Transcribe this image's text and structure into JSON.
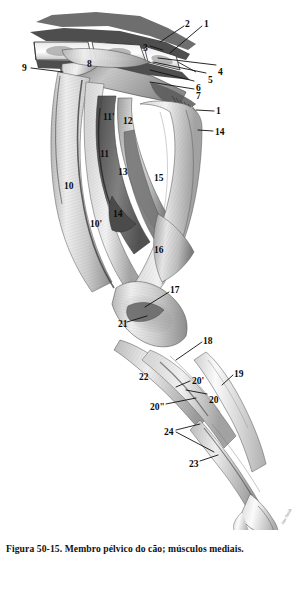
{
  "figure": {
    "caption": "Figura 50-15. Membro pélvico do cão; músculos mediais.",
    "signature": "Jane Smith",
    "colors": {
      "ink": "#0b0b0b",
      "paper": "#ffffff",
      "wash_dark": "#4a4a4a",
      "wash_mid": "#8e8e8e",
      "wash_light": "#d5d5d5",
      "leader_line": "#111111"
    },
    "labels": [
      {
        "id": "label-1-top",
        "text": "1",
        "x": 204,
        "y": 20,
        "leader": {
          "x1": 202,
          "y1": 26,
          "x2": 170,
          "y2": 53
        }
      },
      {
        "id": "label-2",
        "text": "2",
        "x": 185,
        "y": 20,
        "leader": {
          "x1": 184,
          "y1": 26,
          "x2": 160,
          "y2": 42
        }
      },
      {
        "id": "label-3",
        "text": "3",
        "x": 143,
        "y": 44,
        "leader": {
          "x1": 150,
          "y1": 46,
          "x2": 163,
          "y2": 50
        }
      },
      {
        "id": "label-4",
        "text": "4",
        "x": 218,
        "y": 68,
        "leader": {
          "x1": 216,
          "y1": 65,
          "x2": 158,
          "y2": 58
        }
      },
      {
        "id": "label-5",
        "text": "5",
        "x": 208,
        "y": 76,
        "leader": {
          "x1": 206,
          "y1": 73,
          "x2": 153,
          "y2": 62
        }
      },
      {
        "id": "label-6",
        "text": "6",
        "x": 196,
        "y": 84,
        "leader": {
          "x1": 194,
          "y1": 81,
          "x2": 150,
          "y2": 70
        }
      },
      {
        "id": "label-7",
        "text": "7",
        "x": 196,
        "y": 92,
        "leader": {
          "x1": 194,
          "y1": 89,
          "x2": 150,
          "y2": 82
        }
      },
      {
        "id": "label-8",
        "text": "8",
        "x": 87,
        "y": 60,
        "leader": null
      },
      {
        "id": "label-9",
        "text": "9",
        "x": 22,
        "y": 64,
        "leader": {
          "x1": 31,
          "y1": 68,
          "x2": 63,
          "y2": 72
        }
      },
      {
        "id": "label-1-mid",
        "text": "1",
        "x": 216,
        "y": 107,
        "leader": {
          "x1": 214,
          "y1": 111,
          "x2": 196,
          "y2": 110
        }
      },
      {
        "id": "label-14-top",
        "text": "14",
        "x": 215,
        "y": 128,
        "leader": {
          "x1": 213,
          "y1": 131,
          "x2": 198,
          "y2": 130
        }
      },
      {
        "id": "label-11p",
        "text": "11'",
        "x": 103,
        "y": 113,
        "leader": null
      },
      {
        "id": "label-12",
        "text": "12",
        "x": 123,
        "y": 117,
        "leader": null
      },
      {
        "id": "label-11",
        "text": "11",
        "x": 100,
        "y": 150,
        "leader": null
      },
      {
        "id": "label-13",
        "text": "13",
        "x": 118,
        "y": 168,
        "leader": null
      },
      {
        "id": "label-15",
        "text": "15",
        "x": 154,
        "y": 174,
        "leader": null
      },
      {
        "id": "label-10",
        "text": "10",
        "x": 64,
        "y": 182,
        "leader": null
      },
      {
        "id": "label-10p",
        "text": "10'",
        "x": 90,
        "y": 220,
        "leader": null
      },
      {
        "id": "label-14",
        "text": "14",
        "x": 113,
        "y": 210,
        "leader": null
      },
      {
        "id": "label-16",
        "text": "16",
        "x": 154,
        "y": 246,
        "leader": null
      },
      {
        "id": "label-17",
        "text": "17",
        "x": 170,
        "y": 286,
        "leader": {
          "x1": 169,
          "y1": 292,
          "x2": 145,
          "y2": 307
        }
      },
      {
        "id": "label-21",
        "text": "21",
        "x": 118,
        "y": 320,
        "leader": {
          "x1": 127,
          "y1": 322,
          "x2": 147,
          "y2": 316
        }
      },
      {
        "id": "label-18",
        "text": "18",
        "x": 203,
        "y": 337,
        "leader": {
          "x1": 202,
          "y1": 342,
          "x2": 176,
          "y2": 360
        }
      },
      {
        "id": "label-19",
        "text": "19",
        "x": 234,
        "y": 370,
        "leader": {
          "x1": 233,
          "y1": 375,
          "x2": 222,
          "y2": 385
        }
      },
      {
        "id": "label-22",
        "text": "22",
        "x": 139,
        "y": 373,
        "leader": null
      },
      {
        "id": "label-20p",
        "text": "20'",
        "x": 192,
        "y": 377,
        "leader": {
          "x1": 190,
          "y1": 381,
          "x2": 176,
          "y2": 387
        }
      },
      {
        "id": "label-20",
        "text": "20",
        "x": 209,
        "y": 396,
        "leader": {
          "x1": 207,
          "y1": 394,
          "x2": 186,
          "y2": 390
        }
      },
      {
        "id": "label-20pp",
        "text": "20\"",
        "x": 150,
        "y": 403,
        "leader": {
          "x1": 166,
          "y1": 404,
          "x2": 196,
          "y2": 398
        }
      },
      {
        "id": "label-24",
        "text": "24",
        "x": 164,
        "y": 428,
        "leader": {
          "x1": 176,
          "y1": 430,
          "x2": 200,
          "y2": 424
        }
      },
      {
        "id": "label-23",
        "text": "23",
        "x": 189,
        "y": 460,
        "leader": {
          "x1": 200,
          "y1": 461,
          "x2": 218,
          "y2": 455
        }
      }
    ],
    "extra_leaders": [
      {
        "id": "leader-24-second",
        "x1": 176,
        "y1": 432,
        "x2": 214,
        "y2": 452
      }
    ]
  }
}
